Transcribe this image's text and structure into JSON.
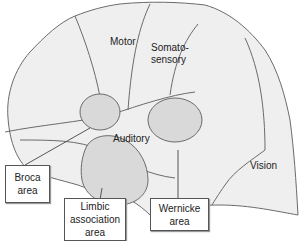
{
  "diagram": {
    "regions": [
      {
        "id": "motor",
        "label": "Motor"
      },
      {
        "id": "somatosensory",
        "label_line1": "Somato-",
        "label_line2": "sensory"
      },
      {
        "id": "auditory",
        "label": "Auditory"
      },
      {
        "id": "vision",
        "label": "Vision"
      }
    ],
    "callouts": [
      {
        "id": "broca",
        "line1": "Broca",
        "line2": "area"
      },
      {
        "id": "limbic",
        "line1": "Limbic",
        "line2": "association",
        "line3": "area"
      },
      {
        "id": "wernicke",
        "line1": "Wernicke",
        "line2": "area"
      }
    ],
    "colors": {
      "cortex_fill": "#efefef",
      "area_fill": "#d9d9d9",
      "outline": "#6b6b6b"
    }
  }
}
